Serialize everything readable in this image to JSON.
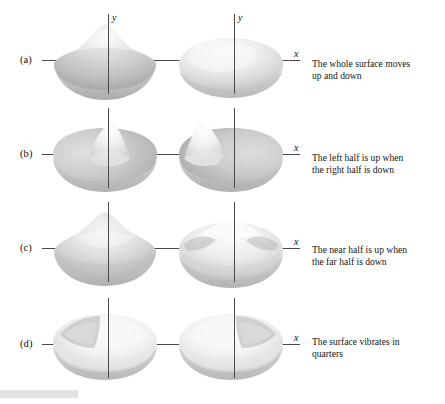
{
  "figure": {
    "title": "",
    "background_color": "#ffffff",
    "axis_color": "#4a4a4a",
    "text_color": "#151515",
    "surface_fill_light": "#f7f7f7",
    "surface_fill_mid": "#c9c9c9",
    "surface_fill_dark": "#9a9a9a",
    "footer_bar_color": "#e3e3e3"
  },
  "axes": {
    "y_label": "y",
    "x_label": "x"
  },
  "rows": [
    {
      "id": "a",
      "label": "(a)",
      "caption": "The whole surface moves up and down",
      "caption_line_1": "The whole surface moves",
      "caption_line_2": "up and down",
      "mode": "fundamental",
      "nodal_lines": 0,
      "left_shape": "dome-peak-centered",
      "right_shape": "flat-dome-ellipse"
    },
    {
      "id": "b",
      "label": "(b)",
      "caption": "The left half is up when the right half is down",
      "caption_line_1": "The left half is up when",
      "caption_line_2": "the right half is down",
      "mode": "one-vertical-nodal-line",
      "nodal_lines": 1,
      "left_shape": "half-peak-right-of-center",
      "right_shape": "half-peak-left-of-center"
    },
    {
      "id": "c",
      "label": "(c)",
      "caption": "The near half is up when the far half is down",
      "caption_line_1": "The near half is up when",
      "caption_line_2": "the far half is down",
      "mode": "one-horizontal-nodal-line",
      "nodal_lines": 1,
      "left_shape": "ridge-peak-back",
      "right_shape": "saddle-ridge-two-lobes"
    },
    {
      "id": "d",
      "label": "(d)",
      "caption": "The surface vibrates in quarters",
      "caption_line_1": "The surface vibrates in",
      "caption_line_2": "quarters",
      "mode": "quartered",
      "nodal_lines": 2,
      "left_shape": "quartered-saddle",
      "right_shape": "quartered-saddle"
    }
  ],
  "footer": {
    "bar_present": true
  }
}
